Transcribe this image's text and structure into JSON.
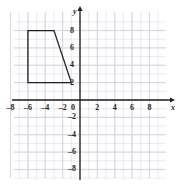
{
  "figure": {
    "kind": "coordinate-plane",
    "background_color": "#ffffff",
    "grid_color": "#cfd4e0",
    "axis_color": "#231f20",
    "shape_color": "#231f20"
  },
  "axes": {
    "x_name": "x",
    "y_name": "y",
    "origin_label": "0",
    "x_ticks": [
      "–8",
      "–6",
      "–4",
      "–2",
      "2",
      "4",
      "6",
      "8"
    ],
    "y_ticks": [
      "8",
      "6",
      "4",
      "2",
      "–2",
      "–4",
      "–6",
      "–8"
    ]
  },
  "chart_data": {
    "type": "scatter",
    "title": "",
    "xlabel": "x",
    "ylabel": "y",
    "xlim": [
      -9,
      9
    ],
    "ylim": [
      -9,
      9
    ],
    "x_tick_values": [
      -8,
      -6,
      -4,
      -2,
      0,
      2,
      4,
      6,
      8
    ],
    "y_tick_values": [
      -8,
      -6,
      -4,
      -2,
      0,
      2,
      4,
      6,
      8
    ],
    "x_minor_step": 1,
    "y_minor_step": 1,
    "grid": true,
    "legend": false,
    "series": [
      {
        "name": "trapezoid",
        "type": "polygon",
        "closed": true,
        "fill": "none",
        "stroke": "#231f20",
        "vertices": [
          [
            -6,
            8
          ],
          [
            -3,
            8
          ],
          [
            -1,
            2
          ],
          [
            -6,
            2
          ]
        ]
      }
    ]
  }
}
